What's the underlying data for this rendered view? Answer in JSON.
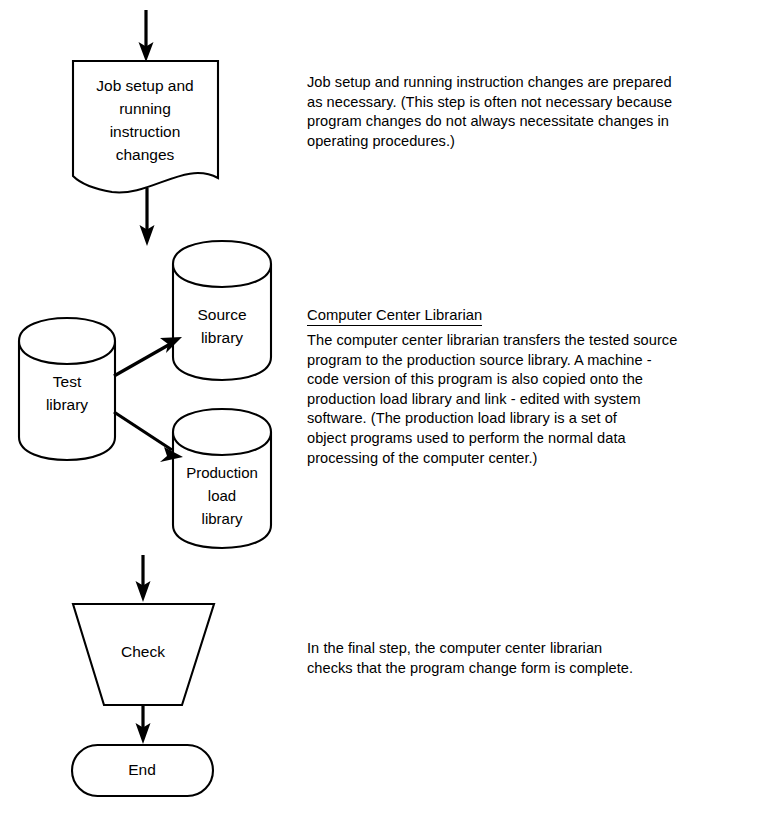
{
  "diagram": {
    "type": "flowchart",
    "nodes": [
      {
        "id": "job-setup",
        "shape": "document",
        "label": "Job setup and\nrunning\ninstruction\nchanges",
        "lines": [
          "Job setup and",
          "running",
          "instruction",
          "changes"
        ]
      },
      {
        "id": "test-library",
        "shape": "cylinder",
        "label": "Test\nlibrary",
        "lines": [
          "Test",
          "library"
        ]
      },
      {
        "id": "source-library",
        "shape": "cylinder",
        "label": "Source\nlibrary",
        "lines": [
          "Source",
          "library"
        ]
      },
      {
        "id": "production-load-library",
        "shape": "cylinder",
        "label": "Production\nload\nlibrary",
        "lines": [
          "Production",
          "load",
          "library"
        ]
      },
      {
        "id": "check",
        "shape": "trapezoid",
        "label": "Check",
        "lines": [
          "Check"
        ]
      },
      {
        "id": "end",
        "shape": "terminator",
        "label": "End",
        "lines": [
          "End"
        ]
      }
    ],
    "edges": [
      {
        "from": "(entry)",
        "to": "job-setup",
        "style": "arrow"
      },
      {
        "from": "job-setup",
        "to": "(libraries)",
        "style": "arrow"
      },
      {
        "from": "test-library",
        "to": "source-library",
        "style": "arrow"
      },
      {
        "from": "test-library",
        "to": "production-load-library",
        "style": "arrow"
      },
      {
        "from": "production-load-library",
        "to": "check",
        "style": "arrow"
      },
      {
        "from": "check",
        "to": "end",
        "style": "arrow"
      }
    ]
  },
  "annotations": {
    "job_setup_note": "Job setup and running instruction changes are prepared\nas necessary.  (This step is often not necessary because\nprogram changes do not always necessitate changes in\noperating procedures.)",
    "librarian_heading": "Computer Center Librarian",
    "librarian_note": " The computer center librarian transfers the tested source\nprogram to the production source library.  A machine -\ncode version of this program is also copied onto the\nproduction load library and link - edited with system\nsoftware.  (The production load library is a set of\nobject programs used to perform the normal  data\nprocessing of the computer center.)",
    "check_note": "In the final step, the computer center librarian\nchecks that the program change form is complete."
  },
  "colors": {
    "stroke": "#000000",
    "fill": "#ffffff",
    "text": "#000000"
  }
}
